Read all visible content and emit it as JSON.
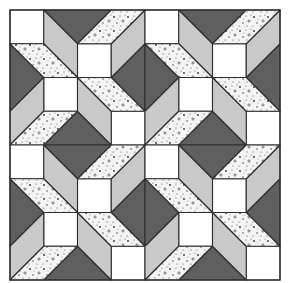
{
  "image": {
    "subject": "Quilt block pattern",
    "description": "2x2 repeat of a pinwheel-style quilt block with white squares, dark gray triangles, light gray and speckled parallelograms"
  },
  "quilt": {
    "origin": [
      10,
      10
    ],
    "block_size": 135,
    "grid_units": 4,
    "rows": 2,
    "cols": 2,
    "colors": {
      "background": "#ffffff",
      "white": "#ffffff",
      "dark": "#5f5f5f",
      "light": "#c9c9c9",
      "speckled_base": "#f4f4f4",
      "speckle": "#333333",
      "outline": "#2e2e2e"
    },
    "pieces": [
      {
        "type": "square",
        "fill": "white",
        "pts": [
          [
            0,
            0
          ],
          [
            1,
            0
          ],
          [
            1,
            1
          ],
          [
            0,
            1
          ]
        ]
      },
      {
        "type": "square",
        "fill": "white",
        "pts": [
          [
            2,
            1
          ],
          [
            3,
            1
          ],
          [
            3,
            2
          ],
          [
            2,
            2
          ]
        ]
      },
      {
        "type": "square",
        "fill": "white",
        "pts": [
          [
            1,
            2
          ],
          [
            2,
            2
          ],
          [
            2,
            3
          ],
          [
            1,
            3
          ]
        ]
      },
      {
        "type": "square",
        "fill": "white",
        "pts": [
          [
            3,
            3
          ],
          [
            4,
            3
          ],
          [
            4,
            4
          ],
          [
            3,
            4
          ]
        ]
      },
      {
        "type": "triangle",
        "fill": "dark",
        "pts": [
          [
            1,
            0
          ],
          [
            3,
            0
          ],
          [
            2,
            1
          ]
        ]
      },
      {
        "type": "triangle",
        "fill": "dark",
        "pts": [
          [
            4,
            1
          ],
          [
            4,
            3
          ],
          [
            3,
            2
          ]
        ]
      },
      {
        "type": "triangle",
        "fill": "dark",
        "pts": [
          [
            1,
            4
          ],
          [
            3,
            4
          ],
          [
            2,
            3
          ]
        ]
      },
      {
        "type": "triangle",
        "fill": "dark",
        "pts": [
          [
            0,
            1
          ],
          [
            0,
            3
          ],
          [
            1,
            2
          ]
        ]
      },
      {
        "type": "parallelogram",
        "fill": "light",
        "pts": [
          [
            1,
            0
          ],
          [
            2,
            1
          ],
          [
            2,
            2
          ],
          [
            1,
            1
          ]
        ]
      },
      {
        "type": "parallelogram",
        "fill": "light",
        "pts": [
          [
            4,
            0
          ],
          [
            4,
            1
          ],
          [
            3,
            2
          ],
          [
            3,
            1
          ]
        ]
      },
      {
        "type": "parallelogram",
        "fill": "light",
        "pts": [
          [
            2,
            2
          ],
          [
            3,
            3
          ],
          [
            3,
            4
          ],
          [
            2,
            3
          ]
        ]
      },
      {
        "type": "parallelogram",
        "fill": "light",
        "pts": [
          [
            1,
            2
          ],
          [
            1,
            3
          ],
          [
            0,
            4
          ],
          [
            0,
            3
          ]
        ]
      },
      {
        "type": "parallelogram",
        "fill": "speckled",
        "pts": [
          [
            0,
            1
          ],
          [
            1,
            1
          ],
          [
            2,
            2
          ],
          [
            1,
            2
          ]
        ]
      },
      {
        "type": "parallelogram",
        "fill": "speckled",
        "pts": [
          [
            3,
            0
          ],
          [
            4,
            0
          ],
          [
            3,
            1
          ],
          [
            2,
            1
          ]
        ]
      },
      {
        "type": "parallelogram",
        "fill": "speckled",
        "pts": [
          [
            2,
            2
          ],
          [
            3,
            2
          ],
          [
            4,
            3
          ],
          [
            3,
            3
          ]
        ]
      },
      {
        "type": "parallelogram",
        "fill": "speckled",
        "pts": [
          [
            1,
            3
          ],
          [
            2,
            3
          ],
          [
            1,
            4
          ],
          [
            0,
            4
          ]
        ]
      }
    ]
  }
}
